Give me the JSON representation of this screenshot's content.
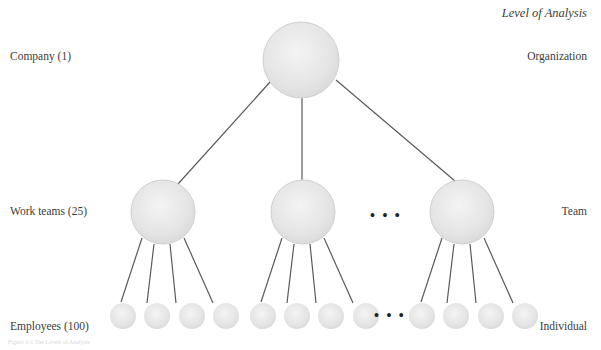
{
  "heading": "Level of Analysis",
  "rows": [
    {
      "left_label": "Company (1)",
      "right_label": "Organization"
    },
    {
      "left_label": "Work teams (25)",
      "right_label": "Team"
    },
    {
      "left_label": "Employees (100)",
      "right_label": "Individual"
    }
  ],
  "ellipsis": "• • •",
  "caption": "Figure 1-1  The Levels of Analysis",
  "colors": {
    "line": "#5a5a5a",
    "node_fill": "#e6e6e6",
    "node_stroke": "#cfcfcf"
  }
}
